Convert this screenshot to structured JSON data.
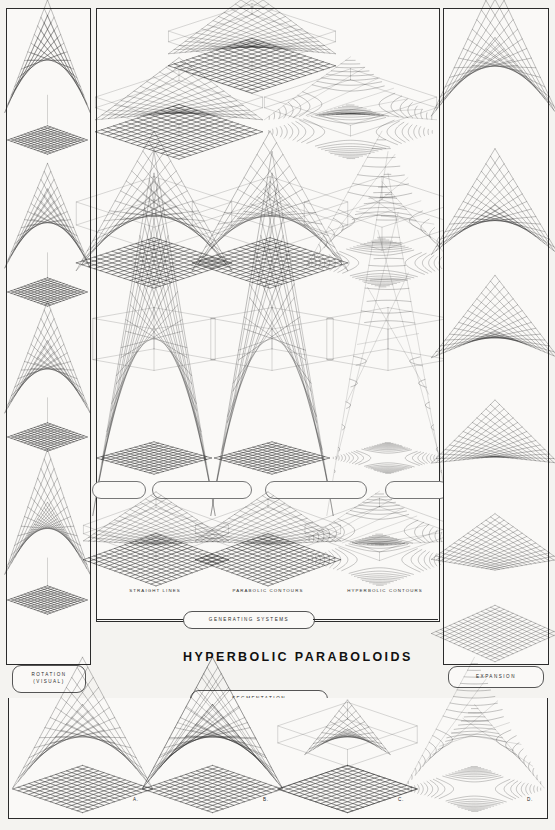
{
  "poster": {
    "title": "HYPERBOLIC PARABOLOIDS",
    "background_color": "#f4f3f0",
    "ink_color": "#1a1a1a"
  },
  "left_column": {
    "label": "ROTATION",
    "sublabel": "(VISUAL)",
    "description": "Saddle surface seen through successive viewing rotations, each above its projected grid plane",
    "frames": 4
  },
  "right_column": {
    "label": "EXPANSION",
    "description": "Saddle surface progressively flattening into a plane",
    "frames": 6
  },
  "center": {
    "generating_systems_label": "GENERATING SYSTEMS",
    "segmentation_label": "SEGMENTATION",
    "captions": [
      "STRAIGHT LINES",
      "PARABOLIC CONTOURS",
      "HYPERBOLIC CONTOURS"
    ],
    "connector_boxes": [
      "",
      "",
      "",
      ""
    ],
    "row_descriptions": [
      "Three saddle surfaces over grid planes, oblique view",
      "Three saddle surfaces in perspective boxes",
      "Three tall generating-system elevations",
      "Three shallow saddle surfaces above contoured planes"
    ]
  },
  "bottom_row": {
    "panels": [
      {
        "letter": "A."
      },
      {
        "letter": "B."
      },
      {
        "letter": "C."
      },
      {
        "letter": "D."
      }
    ]
  },
  "chart_data": {
    "type": "line",
    "title": "HYPERBOLIC PARABOLOIDS",
    "surface_equation": "z = (x^2 - y^2)",
    "xlabel": "x",
    "ylabel": "y",
    "grid": true,
    "legend": [
      "STRAIGHT LINES",
      "PARABOLIC CONTOURS",
      "HYPERBOLIC CONTOURS"
    ],
    "annotations": [
      "ROTATION (VISUAL)",
      "EXPANSION",
      "GENERATING SYSTEMS",
      "SEGMENTATION",
      "A.",
      "B.",
      "C.",
      "D."
    ]
  }
}
